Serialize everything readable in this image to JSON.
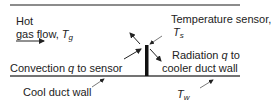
{
  "diagram": {
    "labels": {
      "hot_gas_line1": "Hot",
      "hot_gas_line2": "gas flow, ",
      "hot_gas_symbol": "T",
      "hot_gas_sub": "g",
      "sensor_line1": "Temperature sensor,",
      "sensor_symbol": "T",
      "sensor_sub": "s",
      "convection_pre": "Convection ",
      "convection_q": "q",
      "convection_post": " to sensor",
      "radiation_pre": "Radiation ",
      "radiation_q": "q",
      "radiation_post": " to",
      "radiation_line2": "cooler duct wall",
      "cool_wall": "Cool duct wall",
      "wall_symbol": "T",
      "wall_sub": "w"
    },
    "colors": {
      "line": "#555555",
      "sensor": "#111111",
      "text": "#222222"
    }
  }
}
